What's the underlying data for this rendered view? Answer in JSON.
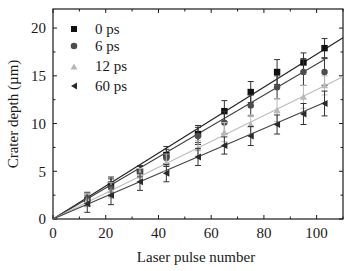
{
  "chart_data": {
    "type": "scatter",
    "title": "",
    "xlabel": "Laser pulse number",
    "ylabel": "Crater depth (µm)",
    "xlim": [
      0,
      110
    ],
    "ylim": [
      0,
      22
    ],
    "xticks": [
      0,
      20,
      40,
      60,
      80,
      100
    ],
    "yticks": [
      0,
      5,
      10,
      15,
      20
    ],
    "grid": false,
    "legend_position": "upper left",
    "x": [
      13,
      22,
      33,
      43,
      55,
      65,
      75,
      85,
      95,
      103
    ],
    "series": [
      {
        "name": "0 ps",
        "marker": "square",
        "color": "#111111",
        "values": [
          2.0,
          3.6,
          5.0,
          6.7,
          8.9,
          11.3,
          13.3,
          15.4,
          16.4,
          17.9
        ],
        "errors": [
          0.7,
          0.8,
          0.6,
          0.9,
          0.9,
          1.1,
          1.1,
          1.3,
          1.0,
          1.0
        ],
        "fit": {
          "x0": 0,
          "y0": 0,
          "x1": 110,
          "y1": 19.0
        }
      },
      {
        "name": "6 ps",
        "marker": "circle",
        "color": "#4d4d4d",
        "values": [
          2.1,
          3.3,
          5.0,
          6.4,
          8.7,
          10.1,
          11.9,
          13.8,
          15.4,
          15.4
        ],
        "errors": [
          0.7,
          0.9,
          0.5,
          0.9,
          0.9,
          1.2,
          1.1,
          1.2,
          1.4,
          1.4
        ],
        "fit": {
          "x0": 0,
          "y0": 0,
          "x1": 103,
          "y1": 16.7
        }
      },
      {
        "name": "12 ps",
        "marker": "triangle-up",
        "color": "#b8b8b8",
        "values": [
          2.0,
          3.0,
          4.8,
          5.9,
          7.4,
          9.1,
          9.9,
          11.4,
          12.8,
          14.0
        ],
        "errors": [
          0.7,
          0.8,
          0.5,
          0.9,
          0.8,
          1.0,
          1.0,
          1.2,
          1.2,
          1.0
        ],
        "fit": {
          "x0": 0,
          "y0": 0,
          "x1": 110,
          "y1": 14.9
        }
      },
      {
        "name": "60 ps",
        "marker": "triangle-left",
        "color": "#2a2a2a",
        "values": [
          1.6,
          2.5,
          3.9,
          4.8,
          6.5,
          7.7,
          8.7,
          9.9,
          11.0,
          12.1
        ],
        "errors": [
          0.9,
          1.0,
          0.9,
          0.9,
          0.9,
          0.9,
          1.0,
          1.0,
          1.1,
          1.3
        ],
        "fit": {
          "x0": 0,
          "y0": 0,
          "x1": 103,
          "y1": 12.2
        }
      }
    ]
  },
  "axes": {
    "x_label": "Laser pulse number",
    "y_label": "Crater depth (µm)",
    "x_tick_labels": [
      "0",
      "20",
      "40",
      "60",
      "80",
      "100"
    ],
    "y_tick_labels": [
      "0",
      "5",
      "10",
      "15",
      "20"
    ]
  },
  "legend": {
    "items": [
      {
        "label": "0 ps",
        "marker": "square-icon"
      },
      {
        "label": "6 ps",
        "marker": "circle-icon"
      },
      {
        "label": "12 ps",
        "marker": "triangle-up-icon"
      },
      {
        "label": "60 ps",
        "marker": "triangle-left-icon"
      }
    ]
  }
}
